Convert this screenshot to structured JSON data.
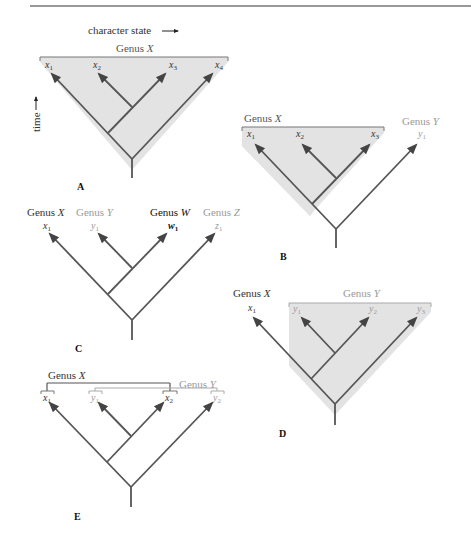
{
  "figure": {
    "axis_labels": {
      "horizontal": "character state",
      "vertical": "time"
    },
    "colors": {
      "shade": "#e3e3e3",
      "branch": "#555555",
      "dark_text": "#333333",
      "light_text": "#9a9a9a"
    },
    "panels": {
      "A": {
        "label": "A",
        "genera": [
          {
            "name": "Genus",
            "var": "X"
          }
        ],
        "tips": [
          {
            "base": "x",
            "sub": "1"
          },
          {
            "base": "x",
            "sub": "2"
          },
          {
            "base": "x",
            "sub": "3"
          },
          {
            "base": "x",
            "sub": "4"
          }
        ]
      },
      "B": {
        "label": "B",
        "genera": [
          {
            "name": "Genus",
            "var": "X"
          },
          {
            "name": "Genus",
            "var": "Y"
          }
        ],
        "tips": [
          {
            "base": "x",
            "sub": "1"
          },
          {
            "base": "x",
            "sub": "2"
          },
          {
            "base": "x",
            "sub": "3"
          },
          {
            "base": "y",
            "sub": "1"
          }
        ]
      },
      "C": {
        "label": "C",
        "genera": [
          {
            "name": "Genus",
            "var": "X"
          },
          {
            "name": "Genus",
            "var": "Y"
          },
          {
            "name": "Genus",
            "var": "W"
          },
          {
            "name": "Genus",
            "var": "Z"
          }
        ],
        "tips": [
          {
            "base": "x",
            "sub": "1"
          },
          {
            "base": "y",
            "sub": "1"
          },
          {
            "base": "w",
            "sub": "1"
          },
          {
            "base": "z",
            "sub": "1"
          }
        ]
      },
      "D": {
        "label": "D",
        "genera": [
          {
            "name": "Genus",
            "var": "X"
          },
          {
            "name": "Genus",
            "var": "Y"
          }
        ],
        "tips": [
          {
            "base": "x",
            "sub": "1"
          },
          {
            "base": "y",
            "sub": "1"
          },
          {
            "base": "y",
            "sub": "2"
          },
          {
            "base": "y",
            "sub": "3"
          }
        ]
      },
      "E": {
        "label": "E",
        "genera": [
          {
            "name": "Genus",
            "var": "X"
          },
          {
            "name": "Genus",
            "var": "Y"
          }
        ],
        "tips": [
          {
            "base": "x",
            "sub": "1"
          },
          {
            "base": "y",
            "sub": "1"
          },
          {
            "base": "x",
            "sub": "2"
          },
          {
            "base": "y",
            "sub": "2"
          }
        ]
      }
    }
  }
}
